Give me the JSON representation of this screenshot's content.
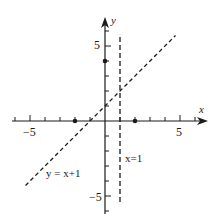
{
  "chart_data": {
    "type": "line",
    "title": "",
    "xlabel": "x",
    "ylabel": "y",
    "xlim": [
      -6.2,
      6.6
    ],
    "ylim": [
      -6.2,
      6.9
    ],
    "grid": false,
    "x_tick_labels": [
      {
        "value": -5,
        "label": "-5"
      },
      {
        "value": 5,
        "label": "5"
      }
    ],
    "y_tick_labels": [
      {
        "value": 5,
        "label": "5"
      },
      {
        "value": -5,
        "label": "-5"
      }
    ],
    "x_ticks": [
      -6,
      -5,
      -4,
      -3,
      -2,
      -1,
      1,
      2,
      3,
      4,
      5,
      6
    ],
    "y_ticks": [
      -6,
      -5,
      -4,
      -3,
      -2,
      -1,
      1,
      2,
      3,
      4,
      5,
      6
    ],
    "series": [
      {
        "name": "y=x+1",
        "style": "dashed",
        "x": [
          -5.3,
          4.7
        ],
        "y": [
          -4.3,
          5.7
        ],
        "label": "y = x+1"
      },
      {
        "name": "x=1",
        "style": "dashed",
        "x": [
          1,
          1
        ],
        "y": [
          5.6,
          -5.6
        ],
        "label": "x=1"
      }
    ],
    "points": [
      {
        "x": -2,
        "y": 0
      },
      {
        "x": 2,
        "y": 0
      },
      {
        "x": 0,
        "y": 4
      }
    ]
  },
  "labels": {
    "x_axis": "x",
    "y_axis": "y",
    "x_neg5": "−5",
    "x_pos5": "5",
    "y_pos5": "5",
    "y_neg5": "−5",
    "line1": "y = x+1",
    "line2": "x=1"
  }
}
